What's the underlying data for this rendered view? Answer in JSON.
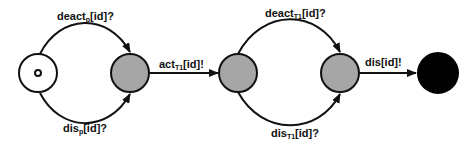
{
  "diagram": {
    "type": "state-machine",
    "colors": {
      "stroke": "#111111",
      "inner_state": "#a6a6a6",
      "final_state": "#000000",
      "initial_state": "#ffffff"
    },
    "nodes": [
      {
        "id": "s0",
        "kind": "initial",
        "fill": "#ffffff"
      },
      {
        "id": "s1",
        "kind": "intermediate",
        "fill": "#a6a6a6"
      },
      {
        "id": "s2",
        "kind": "intermediate",
        "fill": "#a6a6a6"
      },
      {
        "id": "s3",
        "kind": "intermediate",
        "fill": "#a6a6a6"
      },
      {
        "id": "s4",
        "kind": "final",
        "fill": "#000000"
      }
    ],
    "edges": [
      {
        "from": "s0",
        "to": "s1",
        "label": {
          "base": "deact",
          "sub": "p",
          "rest": "[id]?"
        }
      },
      {
        "from": "s0",
        "to": "s1",
        "label": {
          "base": "dis",
          "sub": "p",
          "rest": "[id]?"
        }
      },
      {
        "from": "s1",
        "to": "s2",
        "label": {
          "base": "act",
          "sub": "T1",
          "rest": "[id]!"
        }
      },
      {
        "from": "s2",
        "to": "s3",
        "label": {
          "base": "deact",
          "sub": "T1",
          "rest": "[id]?"
        }
      },
      {
        "from": "s2",
        "to": "s3",
        "label": {
          "base": "dis",
          "sub": "T1",
          "rest": "[id]?"
        }
      },
      {
        "from": "s3",
        "to": "s4",
        "label": {
          "base": "dis",
          "sub": "",
          "rest": "[id]!"
        }
      }
    ]
  }
}
